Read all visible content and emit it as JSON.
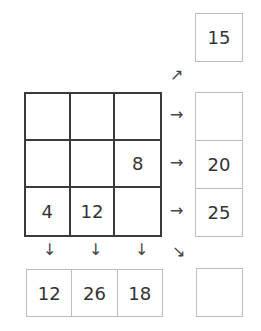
{
  "puzzle": {
    "grid": [
      [
        "",
        "",
        ""
      ],
      [
        "",
        "",
        "8"
      ],
      [
        "4",
        "12",
        ""
      ]
    ],
    "row_sums": [
      "",
      "20",
      "25"
    ],
    "column_sums": [
      "12",
      "26",
      "18"
    ],
    "diagonal_sums": {
      "anti_diagonal": "15",
      "main_diagonal": ""
    }
  },
  "arrows": {
    "right": "→",
    "down": "↓",
    "up_right": "↗",
    "down_right": "↘"
  }
}
